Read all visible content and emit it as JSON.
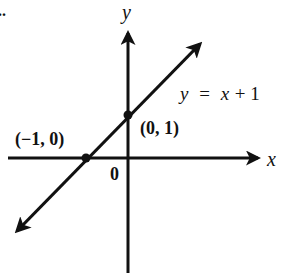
{
  "figure": {
    "marker": "..",
    "axes": {
      "x_label": "x",
      "y_label": "y",
      "origin_label": "0"
    },
    "line": {
      "equation_lhs": "y",
      "equation_eq": "=",
      "equation_rhs_var": "x",
      "equation_rhs_rest": "+ 1",
      "equation": "y = x + 1",
      "slope": 1,
      "intercept": 1
    },
    "points": [
      {
        "label": "(−1, 0)",
        "x": -1,
        "y": 0
      },
      {
        "label": "(0, 1)",
        "x": 0,
        "y": 1
      }
    ],
    "colors": {
      "ink": "#111111",
      "background": "#ffffff"
    }
  }
}
